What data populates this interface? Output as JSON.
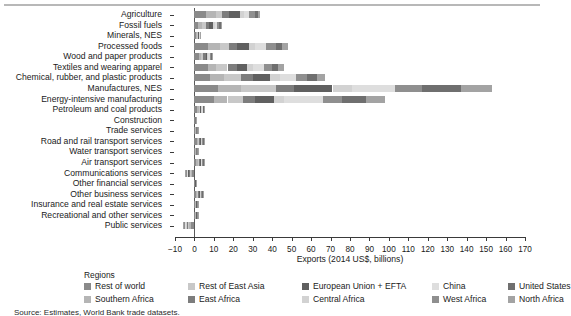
{
  "figure": {
    "source_note": "Source: Estimates, World Bank trade datasets.",
    "legend_title": "Regions"
  },
  "chart_data": {
    "type": "bar",
    "orientation": "horizontal",
    "stacked": true,
    "title": "",
    "xlabel": "Exports (2014 US$, billions)",
    "ylabel": "",
    "xlim": [
      -10,
      170
    ],
    "xticks": [
      -10,
      0,
      10,
      20,
      30,
      40,
      50,
      60,
      70,
      80,
      90,
      100,
      110,
      120,
      130,
      140,
      150,
      160,
      170
    ],
    "xticklabels": [
      "−10",
      "0",
      "10",
      "20",
      "30",
      "40",
      "50",
      "60",
      "70",
      "80",
      "90",
      "100",
      "110",
      "120",
      "130",
      "140",
      "150",
      "160",
      "170"
    ],
    "grid": false,
    "legend_position": "bottom",
    "categories": [
      "Agriculture",
      "Fossil fuels",
      "Minerals, NES",
      "Processed foods",
      "Wood and paper products",
      "Textiles and wearing apparel",
      "Chemical, rubber, and plastic products",
      "Manufactures, NES",
      "Energy-intensive manufacturing",
      "Petroleum and coal products",
      "Construction",
      "Trade services",
      "Road and rail transport services",
      "Water transport services",
      "Air transport services",
      "Communications services",
      "Other financial services",
      "Other business services",
      "Insurance and real estate services",
      "Recreational and other services",
      "Public services"
    ],
    "series": [
      {
        "name": "Rest of world",
        "color": "#8a8a8a",
        "values": [
          6.0,
          2.0,
          1.0,
          7.0,
          2.5,
          7.0,
          8.0,
          12.0,
          10.0,
          1.5,
          0.3,
          0.5,
          1.2,
          0.5,
          1.0,
          -1.2,
          0.2,
          1.0,
          0.4,
          0.4,
          -1.6
        ]
      },
      {
        "name": "Southern Africa",
        "color": "#b5b5b5",
        "values": [
          5.0,
          1.8,
          0.4,
          6.0,
          1.0,
          4.0,
          7.0,
          12.0,
          7.0,
          0.6,
          0.1,
          0.2,
          0.6,
          0.2,
          0.6,
          -0.8,
          0.1,
          0.5,
          0.2,
          0.2,
          -1.0
        ]
      },
      {
        "name": "Rest of East Asia",
        "color": "#c8c8c8",
        "values": [
          3.0,
          2.2,
          0.3,
          5.0,
          0.8,
          6.0,
          9.0,
          18.0,
          8.0,
          0.5,
          0.1,
          0.2,
          0.5,
          0.2,
          0.5,
          -0.5,
          0.1,
          0.5,
          0.2,
          0.2,
          -0.6
        ]
      },
      {
        "name": "East Africa",
        "color": "#7d7d7d",
        "values": [
          4.0,
          1.6,
          0.3,
          4.0,
          1.4,
          5.0,
          6.0,
          9.0,
          6.0,
          0.4,
          0.1,
          0.2,
          0.5,
          0.2,
          0.5,
          -0.4,
          0.1,
          0.4,
          0.2,
          0.2,
          -0.5
        ]
      },
      {
        "name": "European Union + EFTA",
        "color": "#606060",
        "values": [
          5.5,
          2.0,
          0.3,
          6.0,
          1.0,
          5.0,
          9.0,
          20.0,
          10.0,
          0.5,
          0.1,
          0.2,
          0.6,
          0.2,
          0.7,
          -0.5,
          0.1,
          0.5,
          0.2,
          0.2,
          -0.5
        ]
      },
      {
        "name": "Central Africa",
        "color": "#d2d2d2",
        "values": [
          2.0,
          0.8,
          0.2,
          3.0,
          0.5,
          3.0,
          5.0,
          10.0,
          5.0,
          0.3,
          0.05,
          0.1,
          0.3,
          0.1,
          0.3,
          -0.3,
          0.05,
          0.3,
          0.1,
          0.1,
          -0.3
        ]
      },
      {
        "name": "China",
        "color": "#dedede",
        "values": [
          2.5,
          1.0,
          0.2,
          6.0,
          0.6,
          6.0,
          8.0,
          22.0,
          20.0,
          0.4,
          0.05,
          0.1,
          0.4,
          0.1,
          0.4,
          -0.3,
          0.05,
          0.4,
          0.1,
          0.1,
          -0.4
        ]
      },
      {
        "name": "West Africa",
        "color": "#8f8f8f",
        "values": [
          3.0,
          1.4,
          0.2,
          5.0,
          0.9,
          4.0,
          6.0,
          14.0,
          10.0,
          0.4,
          0.05,
          0.2,
          0.4,
          0.2,
          0.4,
          -0.4,
          0.05,
          0.4,
          0.2,
          0.2,
          -0.5
        ]
      },
      {
        "name": "United States",
        "color": "#6f6f6f",
        "values": [
          1.5,
          1.0,
          0.2,
          3.0,
          0.5,
          3.0,
          5.0,
          20.0,
          12.0,
          0.3,
          0.05,
          0.1,
          0.3,
          0.1,
          0.3,
          -0.3,
          0.05,
          0.3,
          0.1,
          0.1,
          -0.3
        ]
      },
      {
        "name": "North Africa",
        "color": "#a3a3a3",
        "values": [
          1.0,
          0.6,
          0.1,
          3.0,
          0.4,
          3.0,
          4.0,
          16.0,
          10.0,
          0.3,
          0.05,
          0.1,
          0.3,
          0.1,
          0.3,
          -0.3,
          0.05,
          0.3,
          0.1,
          0.1,
          -0.3
        ]
      }
    ]
  },
  "legend_items": [
    {
      "label": "Rest of world",
      "color": "#8a8a8a",
      "row": 0,
      "col": 0
    },
    {
      "label": "Rest of East Asia",
      "color": "#c8c8c8",
      "row": 0,
      "col": 1
    },
    {
      "label": "European Union + EFTA",
      "color": "#606060",
      "row": 0,
      "col": 2
    },
    {
      "label": "China",
      "color": "#dedede",
      "row": 0,
      "col": 3
    },
    {
      "label": "United States",
      "color": "#6f6f6f",
      "row": 0,
      "col": 4
    },
    {
      "label": "Southern Africa",
      "color": "#b5b5b5",
      "row": 1,
      "col": 0
    },
    {
      "label": "East Africa",
      "color": "#7d7d7d",
      "row": 1,
      "col": 1
    },
    {
      "label": "Central Africa",
      "color": "#d2d2d2",
      "row": 1,
      "col": 2
    },
    {
      "label": "West Africa",
      "color": "#8f8f8f",
      "row": 1,
      "col": 3
    },
    {
      "label": "North Africa",
      "color": "#a3a3a3",
      "row": 1,
      "col": 4
    }
  ]
}
